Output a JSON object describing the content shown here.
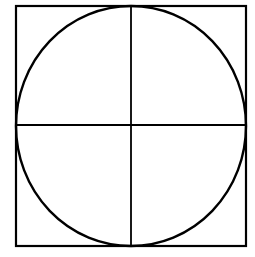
{
  "diagram": {
    "stroke_color": "#000000",
    "background_color": "#ffffff",
    "square": {
      "x": 16,
      "y": 6,
      "width": 230,
      "height": 240,
      "stroke_width": 2.2
    },
    "circle": {
      "cx": 131,
      "cy": 126,
      "rx": 115,
      "ry": 120,
      "stroke_width": 2.4
    },
    "vertical_line": {
      "x": 131,
      "y1": 6,
      "y2": 246,
      "stroke_width": 1.8
    },
    "horizontal_line": {
      "y": 125,
      "x1": 16,
      "x2": 246,
      "stroke_width": 1.8
    }
  }
}
